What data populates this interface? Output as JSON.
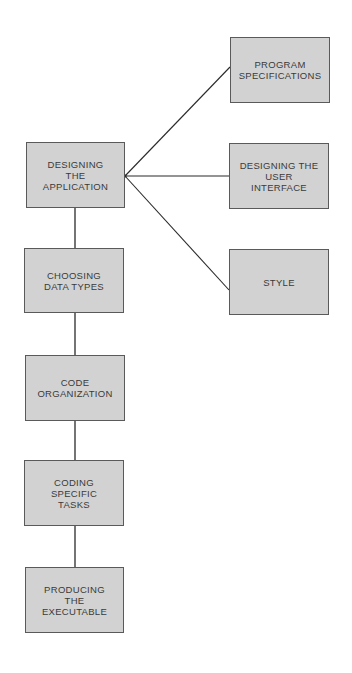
{
  "diagram": {
    "type": "flowchart",
    "colors": {
      "box_fill": "#d2d2d2",
      "box_border": "#5a5a5a",
      "text": "#3a3a3a",
      "line": "#2a2a2a",
      "background": "#ffffff"
    },
    "main_steps": [
      {
        "id": "designing-the-application",
        "label": "DESIGNING\nTHE\nAPPLICATION"
      },
      {
        "id": "choosing-data-types",
        "label": "CHOOSING\nDATA TYPES"
      },
      {
        "id": "code-organization",
        "label": "CODE\nORGANIZATION"
      },
      {
        "id": "coding-specific-tasks",
        "label": "CODING\nSPECIFIC\nTASKS"
      },
      {
        "id": "producing-the-executable",
        "label": "PRODUCING\nTHE\nEXECUTABLE"
      }
    ],
    "sub_steps": [
      {
        "id": "program-specifications",
        "label": "PROGRAM\nSPECIFICATIONS",
        "parent": "designing-the-application"
      },
      {
        "id": "designing-the-user-interface",
        "label": "DESIGNING THE\nUSER\nINTERFACE",
        "parent": "designing-the-application"
      },
      {
        "id": "style",
        "label": "STYLE",
        "parent": "designing-the-application"
      }
    ],
    "edges": [
      {
        "from": "designing-the-application",
        "to": "choosing-data-types"
      },
      {
        "from": "choosing-data-types",
        "to": "code-organization"
      },
      {
        "from": "code-organization",
        "to": "coding-specific-tasks"
      },
      {
        "from": "coding-specific-tasks",
        "to": "producing-the-executable"
      },
      {
        "from": "designing-the-application",
        "to": "program-specifications"
      },
      {
        "from": "designing-the-application",
        "to": "designing-the-user-interface"
      },
      {
        "from": "designing-the-application",
        "to": "style"
      }
    ]
  }
}
